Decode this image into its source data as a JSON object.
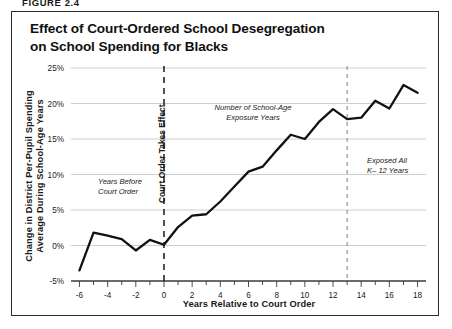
{
  "figure": {
    "number_label": "FIGURE 2.4",
    "title_line_1": "Effect of Court-Ordered School Desegregation",
    "title_line_2": "on School Spending for Blacks",
    "frame_color": "#2b2b2b",
    "line_color": "#111111",
    "grid_color": "#c8c8c8"
  },
  "chart_data": {
    "type": "line",
    "title": "Effect of Court-Ordered School Desegregation on School Spending for Blacks",
    "xlabel": "Years Relative to Court Order",
    "ylabel": "Change in District Per-Pupil Spending Average During School-Age Years",
    "ylabel_line_1": "Change in District Per-Pupil Spending",
    "ylabel_line_2": "Average During School-Age Years",
    "xlim": [
      -6.6,
      18.6
    ],
    "ylim": [
      -5,
      25
    ],
    "grid": true,
    "grid_axis": "y",
    "legend": "none",
    "x_tick_step": 1,
    "x_label_step": 2,
    "y_tick_values": [
      -5,
      0,
      5,
      10,
      15,
      20,
      25
    ],
    "y_tick_labels": [
      "-5%",
      "0%",
      "5%",
      "10%",
      "15%",
      "20%",
      "25%"
    ],
    "x_tick_values": [
      -6,
      -5,
      -4,
      -3,
      -2,
      -1,
      0,
      1,
      2,
      3,
      4,
      5,
      6,
      7,
      8,
      9,
      10,
      11,
      12,
      13,
      14,
      15,
      16,
      17,
      18
    ],
    "x_tick_labels": [
      "-6",
      "",
      "-4",
      "",
      "-2",
      "",
      "0",
      "",
      "2",
      "",
      "4",
      "",
      "6",
      "",
      "8",
      "",
      "10",
      "",
      "12",
      "",
      "14",
      "",
      "16",
      "",
      "18"
    ],
    "x": [
      -6,
      -5,
      -4,
      -3,
      -2,
      -1,
      0,
      1,
      2,
      3,
      4,
      5,
      6,
      7,
      8,
      9,
      10,
      11,
      12,
      13,
      14,
      15,
      16,
      17,
      18
    ],
    "values": [
      -3.5,
      1.8,
      1.4,
      0.9,
      -0.7,
      0.8,
      0.1,
      2.6,
      4.2,
      4.4,
      6.2,
      8.3,
      10.4,
      11.1,
      13.4,
      15.6,
      15.0,
      17.4,
      19.2,
      17.8,
      18.0,
      20.4,
      19.3,
      22.6,
      21.5
    ],
    "series_name": "Change in District Per-Pupil Spending",
    "reference_lines": [
      {
        "name": "court-order-line",
        "x": 0,
        "style": "dashed"
      },
      {
        "name": "full-exposure-line",
        "x": 13,
        "style": "dashed"
      }
    ],
    "annotations": [
      {
        "name": "years-before-court-order",
        "text_line_1": "Years Before",
        "text_line_2": "Court Order",
        "x": -4.3,
        "y": 7.5
      },
      {
        "name": "court-order-takes-effect",
        "text": "Court Order Takes Effect",
        "x": 0,
        "y": 13,
        "orientation": "vertical"
      },
      {
        "name": "number-of-school-age-exposure-years",
        "text_line_1": "Number of School-Age",
        "text_line_2": "Exposure Years",
        "x": 5.6,
        "y": 21.3
      },
      {
        "name": "exposed-all-k12-years",
        "text_line_1": "Exposed All",
        "text_line_2": "K– 12 Years",
        "x": 15.4,
        "y": 12.6
      }
    ]
  }
}
